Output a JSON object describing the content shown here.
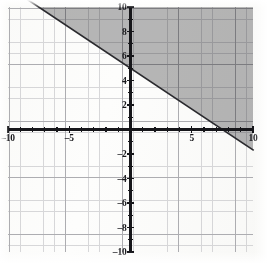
{
  "chart_data": {
    "type": "line",
    "title": "",
    "subtitle": "",
    "xlabel": "",
    "ylabel": "",
    "xlim": [
      -10,
      10
    ],
    "ylim": [
      -10,
      10
    ],
    "grid": true,
    "grid_minor_step": 1,
    "grid_major_step": 5,
    "legend": null,
    "x_tick_labels": [
      "–10",
      "–5",
      "5",
      "10"
    ],
    "x_tick_values": [
      -10,
      -5,
      5,
      10
    ],
    "y_tick_labels": [
      "10",
      "8",
      "6",
      "4",
      "2",
      "–2",
      "–4",
      "–6",
      "–8",
      "–10"
    ],
    "y_tick_values": [
      10,
      8,
      6,
      4,
      2,
      -2,
      -4,
      -6,
      -8,
      -10
    ],
    "series": [
      {
        "name": "boundary-line",
        "kind": "line",
        "style": "solid",
        "slope": -0.6667,
        "y_intercept": 5,
        "x_intercept": 7.5,
        "equation": "y = -2x/3 + 5",
        "endpoints": [
          [
            -7.5,
            10
          ],
          [
            10,
            -1.667
          ]
        ],
        "color": "#2a2a2e"
      }
    ],
    "shaded_region": {
      "name": "solution-region",
      "description": "half-plane above and right of the boundary line",
      "inequality": "y ≥ -2x/3 + 5",
      "color": "#8a8a8c",
      "includes_boundary": true
    },
    "axes": {
      "x_axis_color": "#16161a",
      "y_axis_color": "#16161a",
      "minor_grid_color": "#c9c9cc",
      "major_grid_color": "#a6a6ab"
    }
  },
  "figure": {
    "background_color": "#fdfdfc",
    "shade_color": "#8a8a8c",
    "line_color": "#2a2a2e"
  }
}
